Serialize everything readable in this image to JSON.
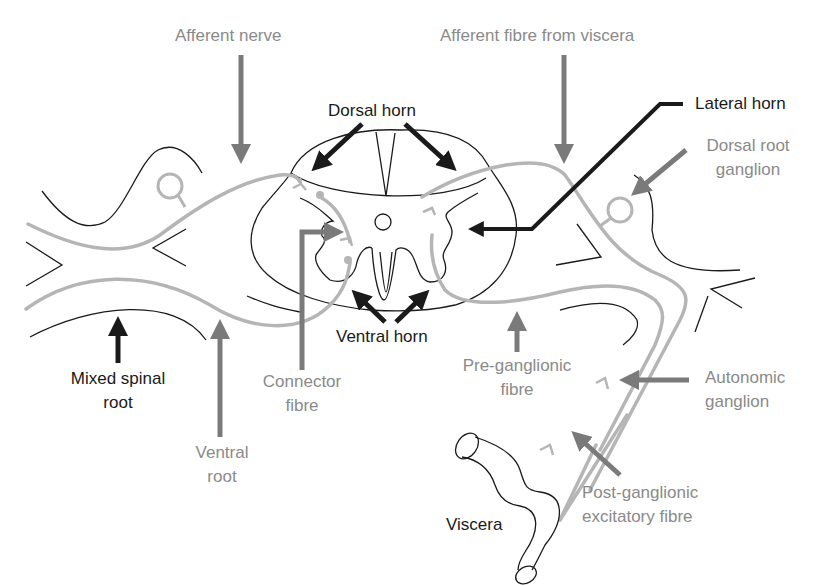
{
  "diagram": {
    "colors": {
      "outline": "#1a1a1a",
      "fibre": "#b5b5b5",
      "grey_arrow": "#7a7a7a",
      "dark_arrow": "#1a1a1a",
      "grey_text": "#8a8a8a",
      "dark_text": "#1a1a1a"
    },
    "labels": {
      "afferent_nerve": "Afferent nerve",
      "afferent_fibre_viscera": "Afferent fibre from viscera",
      "dorsal_horn": "Dorsal horn",
      "lateral_horn": "Lateral horn",
      "dorsal_root_ganglion_1": "Dorsal root",
      "dorsal_root_ganglion_2": "ganglion",
      "mixed_spinal_root_1": "Mixed spinal",
      "mixed_spinal_root_2": "root",
      "connector_fibre_1": "Connector",
      "connector_fibre_2": "fibre",
      "ventral_horn": "Ventral horn",
      "ventral_root_1": "Ventral",
      "ventral_root_2": "root",
      "pre_ganglionic_1": "Pre-ganglionic",
      "pre_ganglionic_2": "fibre",
      "autonomic_ganglion_1": "Autonomic",
      "autonomic_ganglion_2": "ganglion",
      "post_ganglionic_1": "Post-ganglionic",
      "post_ganglionic_2": "excitatory fibre",
      "viscera": "Viscera"
    }
  }
}
